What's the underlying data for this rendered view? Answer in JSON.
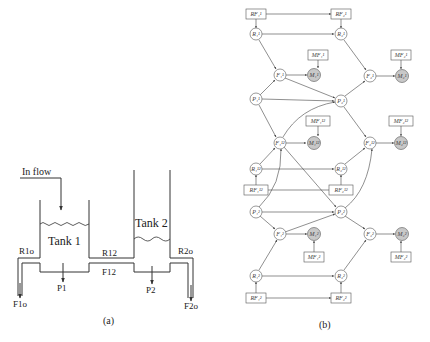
{
  "panel_a": {
    "caption": "(a)",
    "inflow_label": "In flow",
    "tank1_label": "Tank 1",
    "tank2_label": "Tank 2",
    "pipe_labels": {
      "r1o": "R1o",
      "r12": "R12",
      "r2o": "R2o",
      "f12": "F12",
      "f1o": "F1o",
      "f2o": "F2o",
      "p1": "P1",
      "p2": "P2"
    }
  },
  "panel_b": {
    "caption": "(b)",
    "colors": {
      "measurement_fill": "#c8c8c8",
      "stroke": "#555555",
      "hidden_fill": "#ffffff"
    },
    "nodes": {
      "rf1_1": "RF₁¹",
      "rf2_1": "RF₂¹",
      "r1_1": "R₁¹",
      "r2_1": "R₂¹",
      "mf1_1": "MF₁¹",
      "mf2_1": "MF₂¹",
      "f1_1": "F₁¹",
      "m1_1": "M₁¹",
      "f2_1": "F₂¹",
      "m2_1": "M₂¹",
      "p1_1": "P₁¹",
      "p2_1": "P₂¹",
      "mf1_12": "MF₁¹²",
      "mf2_12": "MF₂¹²",
      "f1_12": "F₁¹²",
      "m1_12": "M₁¹²",
      "f2_12": "F₂¹²",
      "m2_12": "M₂¹²",
      "r1_12": "R₁¹²",
      "r2_12": "R₂¹²",
      "rf1_12": "RF₁¹²",
      "rf2_12": "RF₂¹²",
      "p1_2": "P₁²",
      "p2_2": "P₂²",
      "f1_2": "F₁²",
      "m1_2": "M₁²",
      "f2_2": "F₂²",
      "m2_2": "M₂²",
      "mf1_2": "MF₁²",
      "mf2_2": "MF₂²",
      "r1_2": "R₁²",
      "r2_2": "R₂²",
      "rf1_2": "RF₁²",
      "rf2_2": "RF₂²"
    }
  }
}
